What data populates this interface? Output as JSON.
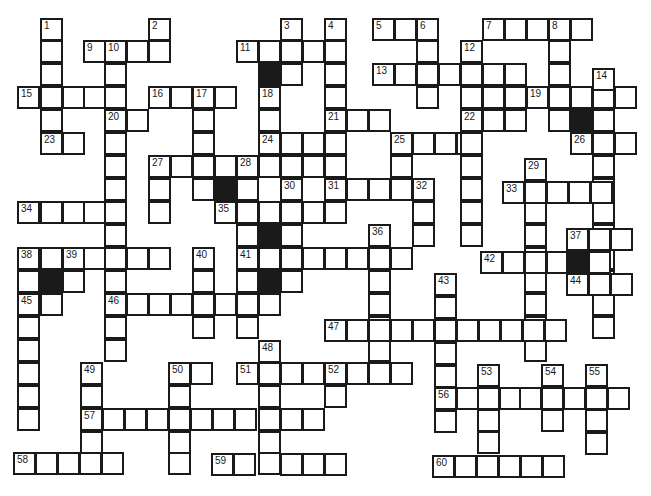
{
  "puzzle": {
    "type": "crossword",
    "cell_size": 23,
    "colors": {
      "line": "#1a1a1a",
      "block": "#1a1a1a",
      "background": "#ffffff"
    },
    "cells": [
      {
        "x": 40,
        "y": 18,
        "n": "1"
      },
      {
        "x": 40,
        "y": 40
      },
      {
        "x": 40,
        "y": 63
      },
      {
        "x": 40,
        "y": 86
      },
      {
        "x": 40,
        "y": 109
      },
      {
        "x": 40,
        "y": 132,
        "n": "23"
      },
      {
        "x": 62,
        "y": 132
      },
      {
        "x": 148,
        "y": 18,
        "n": "2"
      },
      {
        "x": 148,
        "y": 40
      },
      {
        "x": 83,
        "y": 40,
        "n": "9"
      },
      {
        "x": 104,
        "y": 40,
        "n": "10"
      },
      {
        "x": 126,
        "y": 40
      },
      {
        "x": 104,
        "y": 63
      },
      {
        "x": 104,
        "y": 86
      },
      {
        "x": 17,
        "y": 86,
        "n": "15"
      },
      {
        "x": 62,
        "y": 86
      },
      {
        "x": 83,
        "y": 86
      },
      {
        "x": 104,
        "y": 109,
        "n": "20"
      },
      {
        "x": 126,
        "y": 109
      },
      {
        "x": 104,
        "y": 132
      },
      {
        "x": 104,
        "y": 155
      },
      {
        "x": 104,
        "y": 178
      },
      {
        "x": 104,
        "y": 201
      },
      {
        "x": 104,
        "y": 224
      },
      {
        "x": 104,
        "y": 247
      },
      {
        "x": 104,
        "y": 270
      },
      {
        "x": 104,
        "y": 293,
        "n": "46"
      },
      {
        "x": 104,
        "y": 316
      },
      {
        "x": 104,
        "y": 339
      },
      {
        "x": 17,
        "y": 201,
        "n": "34"
      },
      {
        "x": 40,
        "y": 201
      },
      {
        "x": 62,
        "y": 201
      },
      {
        "x": 83,
        "y": 201
      },
      {
        "x": 17,
        "y": 247,
        "n": "38"
      },
      {
        "x": 40,
        "y": 247
      },
      {
        "x": 62,
        "y": 247,
        "n": "39"
      },
      {
        "x": 83,
        "y": 247
      },
      {
        "x": 126,
        "y": 247
      },
      {
        "x": 148,
        "y": 247
      },
      {
        "x": 17,
        "y": 270
      },
      {
        "x": 40,
        "y": 270,
        "b": true
      },
      {
        "x": 62,
        "y": 270
      },
      {
        "x": 17,
        "y": 293,
        "n": "45"
      },
      {
        "x": 40,
        "y": 293
      },
      {
        "x": 17,
        "y": 316
      },
      {
        "x": 17,
        "y": 339
      },
      {
        "x": 17,
        "y": 362
      },
      {
        "x": 17,
        "y": 385
      },
      {
        "x": 17,
        "y": 408
      },
      {
        "x": 148,
        "y": 86,
        "n": "16"
      },
      {
        "x": 170,
        "y": 86
      },
      {
        "x": 192,
        "y": 86,
        "n": "17"
      },
      {
        "x": 214,
        "y": 86
      },
      {
        "x": 192,
        "y": 109
      },
      {
        "x": 192,
        "y": 132
      },
      {
        "x": 192,
        "y": 155
      },
      {
        "x": 192,
        "y": 178
      },
      {
        "x": 148,
        "y": 155,
        "n": "27"
      },
      {
        "x": 170,
        "y": 155
      },
      {
        "x": 214,
        "y": 155
      },
      {
        "x": 236,
        "y": 155,
        "n": "28"
      },
      {
        "x": 258,
        "y": 155
      },
      {
        "x": 280,
        "y": 155
      },
      {
        "x": 302,
        "y": 155
      },
      {
        "x": 148,
        "y": 178
      },
      {
        "x": 148,
        "y": 201
      },
      {
        "x": 214,
        "y": 178,
        "b": true
      },
      {
        "x": 236,
        "y": 178
      },
      {
        "x": 214,
        "y": 201,
        "n": "35"
      },
      {
        "x": 236,
        "y": 201
      },
      {
        "x": 258,
        "y": 201
      },
      {
        "x": 280,
        "y": 201
      },
      {
        "x": 302,
        "y": 201
      },
      {
        "x": 236,
        "y": 224
      },
      {
        "x": 258,
        "y": 224,
        "b": true
      },
      {
        "x": 280,
        "y": 224
      },
      {
        "x": 236,
        "y": 247,
        "n": "41"
      },
      {
        "x": 258,
        "y": 247
      },
      {
        "x": 280,
        "y": 247
      },
      {
        "x": 302,
        "y": 247
      },
      {
        "x": 324,
        "y": 247
      },
      {
        "x": 346,
        "y": 247
      },
      {
        "x": 368,
        "y": 247
      },
      {
        "x": 390,
        "y": 247
      },
      {
        "x": 236,
        "y": 270
      },
      {
        "x": 258,
        "y": 270,
        "b": true
      },
      {
        "x": 280,
        "y": 270
      },
      {
        "x": 126,
        "y": 293
      },
      {
        "x": 148,
        "y": 293
      },
      {
        "x": 170,
        "y": 293
      },
      {
        "x": 192,
        "y": 293
      },
      {
        "x": 214,
        "y": 293
      },
      {
        "x": 236,
        "y": 293
      },
      {
        "x": 258,
        "y": 293
      },
      {
        "x": 192,
        "y": 247,
        "n": "40"
      },
      {
        "x": 192,
        "y": 270
      },
      {
        "x": 192,
        "y": 316
      },
      {
        "x": 236,
        "y": 316
      },
      {
        "x": 236,
        "y": 40,
        "n": "11"
      },
      {
        "x": 258,
        "y": 40
      },
      {
        "x": 280,
        "y": 40
      },
      {
        "x": 302,
        "y": 40
      },
      {
        "x": 324,
        "y": 40
      },
      {
        "x": 280,
        "y": 18,
        "n": "3"
      },
      {
        "x": 258,
        "y": 63,
        "b": true
      },
      {
        "x": 280,
        "y": 63
      },
      {
        "x": 324,
        "y": 18,
        "n": "4"
      },
      {
        "x": 324,
        "y": 63
      },
      {
        "x": 324,
        "y": 86
      },
      {
        "x": 324,
        "y": 109,
        "n": "21"
      },
      {
        "x": 346,
        "y": 109
      },
      {
        "x": 368,
        "y": 109
      },
      {
        "x": 258,
        "y": 86,
        "n": "18"
      },
      {
        "x": 258,
        "y": 109
      },
      {
        "x": 258,
        "y": 132,
        "n": "24"
      },
      {
        "x": 280,
        "y": 132
      },
      {
        "x": 302,
        "y": 132
      },
      {
        "x": 324,
        "y": 132
      },
      {
        "x": 324,
        "y": 155
      },
      {
        "x": 280,
        "y": 178,
        "n": "30"
      },
      {
        "x": 280,
        "y": 224
      },
      {
        "x": 324,
        "y": 178,
        "n": "31"
      },
      {
        "x": 346,
        "y": 178
      },
      {
        "x": 368,
        "y": 178
      },
      {
        "x": 390,
        "y": 178
      },
      {
        "x": 412,
        "y": 178,
        "n": "32"
      },
      {
        "x": 324,
        "y": 201
      },
      {
        "x": 412,
        "y": 201
      },
      {
        "x": 412,
        "y": 224
      },
      {
        "x": 390,
        "y": 132,
        "n": "25"
      },
      {
        "x": 412,
        "y": 132
      },
      {
        "x": 434,
        "y": 132
      },
      {
        "x": 456,
        "y": 132
      },
      {
        "x": 390,
        "y": 155
      },
      {
        "x": 368,
        "y": 224,
        "n": "36"
      },
      {
        "x": 368,
        "y": 270
      },
      {
        "x": 368,
        "y": 293
      },
      {
        "x": 368,
        "y": 316
      },
      {
        "x": 368,
        "y": 339
      },
      {
        "x": 368,
        "y": 362
      },
      {
        "x": 372,
        "y": 18,
        "n": "5"
      },
      {
        "x": 394,
        "y": 18
      },
      {
        "x": 416,
        "y": 18,
        "n": "6"
      },
      {
        "x": 416,
        "y": 40
      },
      {
        "x": 416,
        "y": 63
      },
      {
        "x": 416,
        "y": 86
      },
      {
        "x": 372,
        "y": 63,
        "n": "13"
      },
      {
        "x": 394,
        "y": 63
      },
      {
        "x": 438,
        "y": 63
      },
      {
        "x": 460,
        "y": 63
      },
      {
        "x": 482,
        "y": 63
      },
      {
        "x": 504,
        "y": 63
      },
      {
        "x": 482,
        "y": 18,
        "n": "7"
      },
      {
        "x": 504,
        "y": 18
      },
      {
        "x": 526,
        "y": 18
      },
      {
        "x": 548,
        "y": 18,
        "n": "8"
      },
      {
        "x": 570,
        "y": 18
      },
      {
        "x": 548,
        "y": 40
      },
      {
        "x": 548,
        "y": 63
      },
      {
        "x": 548,
        "y": 86
      },
      {
        "x": 548,
        "y": 109
      },
      {
        "x": 460,
        "y": 40,
        "n": "12"
      },
      {
        "x": 460,
        "y": 86
      },
      {
        "x": 460,
        "y": 109,
        "n": "22"
      },
      {
        "x": 482,
        "y": 109
      },
      {
        "x": 504,
        "y": 109
      },
      {
        "x": 460,
        "y": 132
      },
      {
        "x": 460,
        "y": 155
      },
      {
        "x": 460,
        "y": 178
      },
      {
        "x": 460,
        "y": 201
      },
      {
        "x": 460,
        "y": 224
      },
      {
        "x": 482,
        "y": 86
      },
      {
        "x": 504,
        "y": 86
      },
      {
        "x": 526,
        "y": 86,
        "n": "19"
      },
      {
        "x": 570,
        "y": 86
      },
      {
        "x": 592,
        "y": 86
      },
      {
        "x": 614,
        "y": 86
      },
      {
        "x": 592,
        "y": 68,
        "n": "14"
      },
      {
        "x": 570,
        "y": 109,
        "b": true
      },
      {
        "x": 592,
        "y": 109
      },
      {
        "x": 570,
        "y": 132,
        "n": "26"
      },
      {
        "x": 592,
        "y": 132
      },
      {
        "x": 614,
        "y": 132
      },
      {
        "x": 592,
        "y": 155
      },
      {
        "x": 592,
        "y": 178
      },
      {
        "x": 592,
        "y": 201
      },
      {
        "x": 592,
        "y": 224
      },
      {
        "x": 592,
        "y": 247
      },
      {
        "x": 592,
        "y": 270
      },
      {
        "x": 592,
        "y": 293
      },
      {
        "x": 592,
        "y": 316
      },
      {
        "x": 524,
        "y": 158,
        "n": "29"
      },
      {
        "x": 524,
        "y": 201
      },
      {
        "x": 524,
        "y": 224
      },
      {
        "x": 524,
        "y": 247
      },
      {
        "x": 524,
        "y": 270
      },
      {
        "x": 524,
        "y": 293
      },
      {
        "x": 524,
        "y": 316
      },
      {
        "x": 524,
        "y": 339
      },
      {
        "x": 502,
        "y": 181,
        "n": "33"
      },
      {
        "x": 524,
        "y": 181
      },
      {
        "x": 546,
        "y": 181
      },
      {
        "x": 568,
        "y": 181
      },
      {
        "x": 590,
        "y": 181
      },
      {
        "x": 566,
        "y": 228,
        "n": "37"
      },
      {
        "x": 588,
        "y": 228
      },
      {
        "x": 610,
        "y": 228
      },
      {
        "x": 480,
        "y": 251,
        "n": "42"
      },
      {
        "x": 502,
        "y": 251
      },
      {
        "x": 524,
        "y": 251
      },
      {
        "x": 546,
        "y": 251
      },
      {
        "x": 566,
        "y": 251,
        "b": true
      },
      {
        "x": 588,
        "y": 251
      },
      {
        "x": 566,
        "y": 273,
        "n": "44"
      },
      {
        "x": 588,
        "y": 273
      },
      {
        "x": 610,
        "y": 273
      },
      {
        "x": 434,
        "y": 273,
        "n": "43"
      },
      {
        "x": 434,
        "y": 296
      },
      {
        "x": 434,
        "y": 319
      },
      {
        "x": 434,
        "y": 342
      },
      {
        "x": 434,
        "y": 365
      },
      {
        "x": 434,
        "y": 410
      },
      {
        "x": 324,
        "y": 319,
        "n": "47"
      },
      {
        "x": 346,
        "y": 319
      },
      {
        "x": 368,
        "y": 319
      },
      {
        "x": 390,
        "y": 319
      },
      {
        "x": 412,
        "y": 319
      },
      {
        "x": 456,
        "y": 319
      },
      {
        "x": 478,
        "y": 319
      },
      {
        "x": 500,
        "y": 319
      },
      {
        "x": 522,
        "y": 319
      },
      {
        "x": 544,
        "y": 319
      },
      {
        "x": 258,
        "y": 340,
        "n": "48"
      },
      {
        "x": 236,
        "y": 362,
        "n": "51"
      },
      {
        "x": 258,
        "y": 362
      },
      {
        "x": 280,
        "y": 362
      },
      {
        "x": 302,
        "y": 362
      },
      {
        "x": 324,
        "y": 362,
        "n": "52"
      },
      {
        "x": 346,
        "y": 362
      },
      {
        "x": 390,
        "y": 362
      },
      {
        "x": 324,
        "y": 385
      },
      {
        "x": 258,
        "y": 385
      },
      {
        "x": 258,
        "y": 408
      },
      {
        "x": 258,
        "y": 431
      },
      {
        "x": 258,
        "y": 452
      },
      {
        "x": 80,
        "y": 362,
        "n": "49"
      },
      {
        "x": 80,
        "y": 385
      },
      {
        "x": 80,
        "y": 408,
        "n": "57"
      },
      {
        "x": 80,
        "y": 431
      },
      {
        "x": 102,
        "y": 408
      },
      {
        "x": 124,
        "y": 408
      },
      {
        "x": 146,
        "y": 408
      },
      {
        "x": 168,
        "y": 408
      },
      {
        "x": 190,
        "y": 408
      },
      {
        "x": 212,
        "y": 408
      },
      {
        "x": 234,
        "y": 408
      },
      {
        "x": 280,
        "y": 408
      },
      {
        "x": 302,
        "y": 408
      },
      {
        "x": 168,
        "y": 362,
        "n": "50"
      },
      {
        "x": 190,
        "y": 362
      },
      {
        "x": 168,
        "y": 385
      },
      {
        "x": 168,
        "y": 431
      },
      {
        "x": 168,
        "y": 452
      },
      {
        "x": 13,
        "y": 452,
        "n": "58"
      },
      {
        "x": 35,
        "y": 452
      },
      {
        "x": 57,
        "y": 452
      },
      {
        "x": 79,
        "y": 452
      },
      {
        "x": 101,
        "y": 452
      },
      {
        "x": 211,
        "y": 453,
        "n": "59"
      },
      {
        "x": 233,
        "y": 453
      },
      {
        "x": 280,
        "y": 453
      },
      {
        "x": 302,
        "y": 453
      },
      {
        "x": 324,
        "y": 453
      },
      {
        "x": 477,
        "y": 364,
        "n": "53"
      },
      {
        "x": 477,
        "y": 409
      },
      {
        "x": 477,
        "y": 431
      },
      {
        "x": 541,
        "y": 364,
        "n": "54"
      },
      {
        "x": 541,
        "y": 409
      },
      {
        "x": 585,
        "y": 364,
        "n": "55"
      },
      {
        "x": 585,
        "y": 409
      },
      {
        "x": 585,
        "y": 432
      },
      {
        "x": 434,
        "y": 387,
        "n": "56"
      },
      {
        "x": 456,
        "y": 387
      },
      {
        "x": 477,
        "y": 387
      },
      {
        "x": 499,
        "y": 387
      },
      {
        "x": 519,
        "y": 387
      },
      {
        "x": 541,
        "y": 387
      },
      {
        "x": 563,
        "y": 387
      },
      {
        "x": 585,
        "y": 387
      },
      {
        "x": 607,
        "y": 387
      },
      {
        "x": 432,
        "y": 455,
        "n": "60"
      },
      {
        "x": 454,
        "y": 455
      },
      {
        "x": 476,
        "y": 455
      },
      {
        "x": 498,
        "y": 455
      },
      {
        "x": 520,
        "y": 455
      },
      {
        "x": 542,
        "y": 455
      }
    ]
  }
}
